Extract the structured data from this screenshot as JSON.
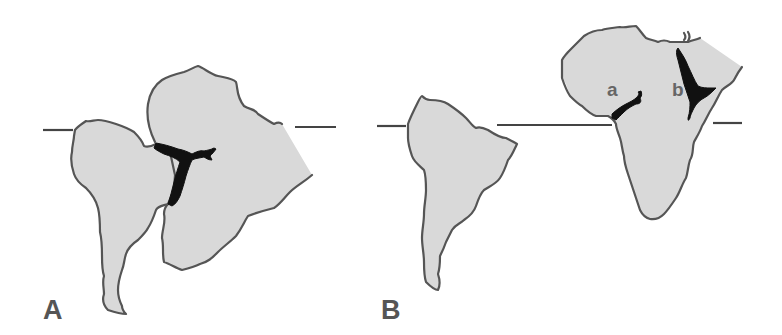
{
  "figure": {
    "panels": [
      {
        "id": "A",
        "label": "A",
        "description": "South America and Africa joined, with a Y-shaped black rift at the junction",
        "equator_line": true
      },
      {
        "id": "B",
        "label": "B",
        "description": "South America and Africa separated by the opened Atlantic; Africa shows two rifts labelled a and b",
        "equator_line": true,
        "rift_labels": [
          "a",
          "b"
        ]
      }
    ],
    "colors": {
      "land_fill": "#d9d9d9",
      "coastline": "#555555",
      "rift": "#111111",
      "label": "#555555",
      "background": "#ffffff"
    }
  }
}
